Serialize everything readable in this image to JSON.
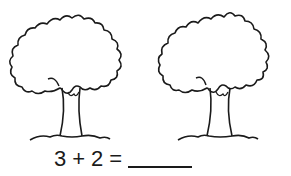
{
  "worksheet": {
    "illustration": {
      "count": 2,
      "item": "tree"
    },
    "equation": {
      "operand_a": "3",
      "operator": "+",
      "operand_b": "2",
      "equals": "=",
      "answer": ""
    }
  }
}
